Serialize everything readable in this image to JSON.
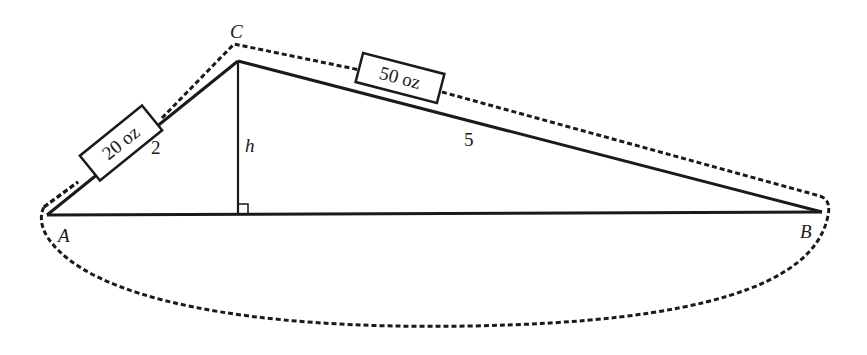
{
  "diagram": {
    "type": "geometry-triangle-with-string",
    "vertices": {
      "A": {
        "label": "A",
        "x": 47,
        "y": 215
      },
      "B": {
        "label": "B",
        "x": 822,
        "y": 212
      },
      "C": {
        "label": "C",
        "x": 238,
        "y": 61
      }
    },
    "side_labels": {
      "AC": "2",
      "CB": "5",
      "altitude": "h"
    },
    "weights": {
      "left": "20 oz",
      "right": "50 oz"
    },
    "right_angle_marker": true,
    "colors": {
      "stroke": "#1a1a1a",
      "background": "#ffffff"
    }
  }
}
